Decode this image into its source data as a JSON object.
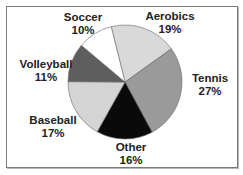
{
  "chart_data": {
    "type": "pie",
    "title": "",
    "categories": [
      "Aerobics",
      "Tennis",
      "Other",
      "Baseball",
      "Volleyball",
      "Soccer"
    ],
    "values": [
      19,
      27,
      16,
      17,
      11,
      10
    ],
    "labels": [
      "19%",
      "27%",
      "16%",
      "17%",
      "11%",
      "10%"
    ],
    "colors": [
      "#d9d9d9",
      "#9a9a9a",
      "#0a0a0a",
      "#d4d4d4",
      "#5e5e5e",
      "#ffffff"
    ],
    "legend": "none",
    "data_labels": "category and percent outside"
  },
  "labels": {
    "aerobics": {
      "name": "Aerobics",
      "pct": "19%"
    },
    "tennis": {
      "name": "Tennis",
      "pct": "27%"
    },
    "other": {
      "name": "Other",
      "pct": "16%"
    },
    "baseball": {
      "name": "Baseball",
      "pct": "17%"
    },
    "volleyball": {
      "name": "Volleyball",
      "pct": "11%"
    },
    "soccer": {
      "name": "Soccer",
      "pct": "10%"
    }
  }
}
